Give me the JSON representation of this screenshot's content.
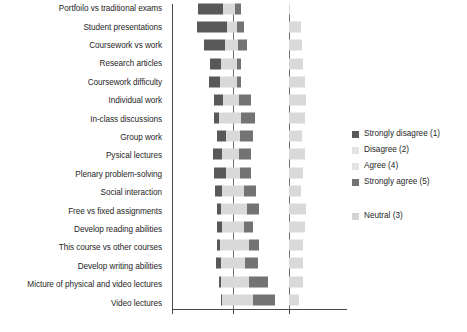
{
  "chart_data": {
    "type": "bar",
    "subtype": "diverging-stacked-likert",
    "title": "",
    "xlabel": "",
    "ylabel": "",
    "grid": true,
    "legend_position": "right",
    "xlim": [
      -60,
      60
    ],
    "x_ticks": [
      -30,
      0,
      30
    ],
    "x_tick_labels": [
      "",
      "",
      ""
    ],
    "center_value": 0,
    "neutral_axis_note": "Neutral (3) drawn as a separate series starting at the right gridline",
    "categories": [
      "Portfoilo vs traditional exams",
      "Student presentations",
      "Coursework vs work",
      "Research articles",
      "Coursework difficulty",
      "Individual work",
      "In-class discussions",
      "Group work",
      "Pysical lectures",
      "Plenary problem-solving",
      "Social interaction",
      "Free vs fixed assignments",
      "Develop reading abilities",
      "This course vs other courses",
      "Develop writing abilities",
      "Micture of physical and video lectures",
      "Video lectures"
    ],
    "series": [
      {
        "name": "Strongly disagree (1)",
        "color": "#595959",
        "values": [
          21,
          25,
          17,
          9,
          9,
          8,
          4,
          7,
          8,
          10,
          6,
          3,
          4,
          2,
          4,
          2,
          1
        ]
      },
      {
        "name": "Disagree (2)",
        "color": "#d9d9d9",
        "values": [
          8,
          5,
          7,
          10,
          11,
          8,
          12,
          6,
          9,
          6,
          9,
          10,
          9,
          11,
          10,
          10,
          9
        ]
      },
      {
        "name": "Agree (4)",
        "color": "#d9d9d9",
        "values": [
          2,
          3,
          4,
          3,
          3,
          5,
          7,
          6,
          5,
          6,
          9,
          12,
          9,
          13,
          10,
          13,
          17
        ]
      },
      {
        "name": "Strongly agree (5)",
        "color": "#737373",
        "values": [
          5,
          6,
          8,
          4,
          4,
          10,
          11,
          11,
          10,
          9,
          10,
          10,
          8,
          9,
          11,
          16,
          18
        ]
      },
      {
        "name": "Neutral (3)",
        "color": "#d9d9d9",
        "values": [
          1,
          10,
          11,
          12,
          13,
          14,
          13,
          11,
          13,
          12,
          10,
          14,
          13,
          12,
          12,
          12,
          8
        ]
      }
    ],
    "legend": [
      {
        "label": "Strongly disagree (1)",
        "color": "#595959"
      },
      {
        "label": "Disagree (2)",
        "color": "#e3e3e3"
      },
      {
        "label": "Agree (4)",
        "color": "#e3e3e3"
      },
      {
        "label": "Strongly agree (5)",
        "color": "#737373"
      },
      {
        "label": "Neutral (3)",
        "color": "#d4d4d4"
      }
    ]
  },
  "colors": {
    "strongly_disagree": "#595959",
    "disagree": "#d9d9d9",
    "agree": "#d9d9d9",
    "strongly_agree": "#737373",
    "neutral": "#d9d9d9",
    "axis": "#4a4a4a",
    "gridline": "#6f6f6f",
    "text": "#262626",
    "background": "#ffffff"
  }
}
